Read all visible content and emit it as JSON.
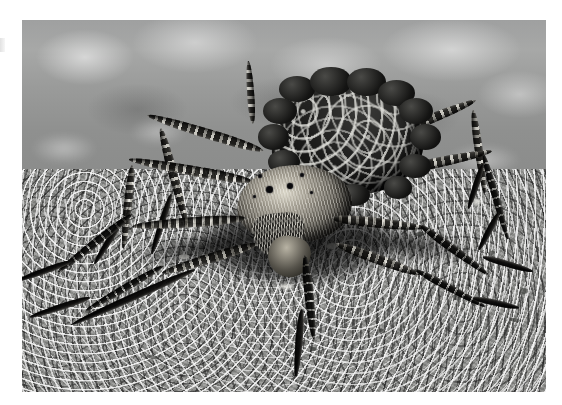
{
  "image": {
    "subject": "wolf spider carrying spiderlings on its abdomen",
    "caption": "",
    "alt_text": "Close-up black and white photograph of a wolf spider standing on sandy gravel ground, its abdomen densely covered with pale-speckled spiderlings",
    "format": "photograph",
    "color_mode": "black-and-white",
    "orientation": "landscape",
    "canvas": {
      "width": 562,
      "height": 405,
      "background_color": "#ffffff"
    },
    "photo_frame": {
      "x": 22,
      "y": 20,
      "width": 524,
      "height": 372
    },
    "palette": {
      "paper_white": "#ffffff",
      "background_blur_grey": "#9fa0a0",
      "gravel_mid_grey": "#8f908d",
      "gravel_highlight": "#efefea",
      "spider_body_black": "#111110",
      "spiderling_speck": "#e1e1dc",
      "leg_band_light": "#ecE9de",
      "leg_band_dark": "#1c1b18",
      "shadow_black": "#000000"
    },
    "regions": [
      {
        "name": "blurred-background",
        "description": "out-of-focus bokeh of bright gravel across the upper third"
      },
      {
        "name": "gravel-ground",
        "description": "sharply focused coarse sand and small stones filling the lower two thirds"
      },
      {
        "name": "spider",
        "description": "large wolf spider centered, facing the camera, eight legs splayed outward"
      },
      {
        "name": "abdomen",
        "description": "dark rounded abdomen blanketed with light-speckled spiderlings"
      },
      {
        "name": "cephalothorax",
        "description": "pale bristly head region with eye cluster and chelicerae"
      },
      {
        "name": "cast-shadow",
        "description": "dense black shadow pooled under the body and legs"
      }
    ]
  }
}
